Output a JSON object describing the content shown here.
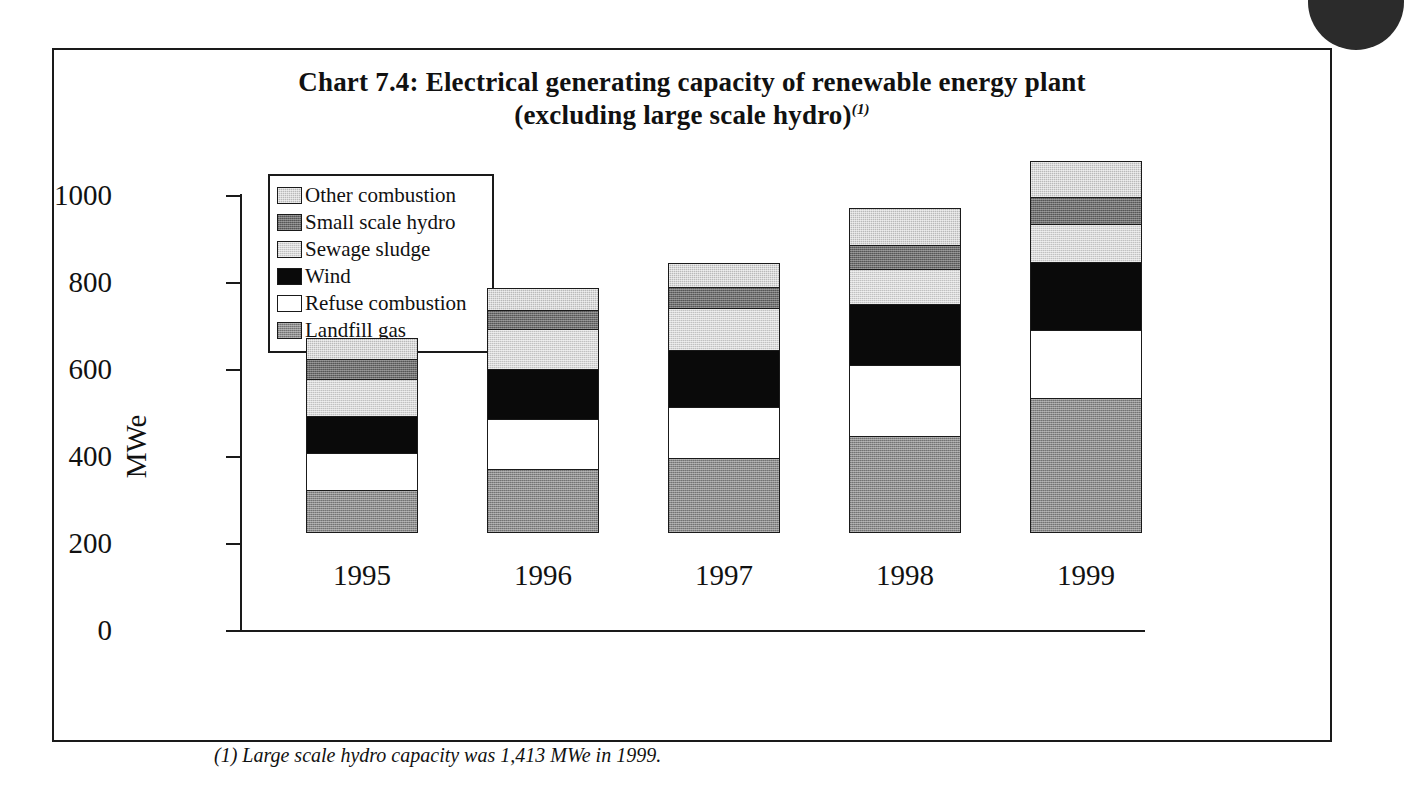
{
  "figure": {
    "title_line1": "Chart 7.4:  Electrical generating capacity of renewable energy plant",
    "title_line2": "(excluding large scale hydro)",
    "title_superscript": "(1)",
    "footnote": "(1) Large scale hydro capacity was 1,413 MWe in 1999."
  },
  "axes": {
    "ylabel": "MWe",
    "yticks": [
      "0",
      "200",
      "400",
      "600",
      "800",
      "1000"
    ],
    "xticks": [
      "1995",
      "1996",
      "1997",
      "1998",
      "1999"
    ]
  },
  "legend": {
    "items": [
      {
        "label": "Other combustion",
        "key": "other-combustion",
        "color": "#b9b9b9"
      },
      {
        "label": "Small scale hydro",
        "key": "small-scale-hydro",
        "color": "#6e6e6e"
      },
      {
        "label": "Sewage sludge",
        "key": "sewage-sludge",
        "color": "#d8d8d8"
      },
      {
        "label": "Wind",
        "key": "wind",
        "color": "#0a0a0a"
      },
      {
        "label": "Refuse combustion",
        "key": "refuse-combustion",
        "color": "#ffffff"
      },
      {
        "label": "Landfill gas",
        "key": "landfill-gas",
        "color": "#8c8c8c"
      }
    ]
  },
  "chart_data": {
    "type": "bar",
    "stacked": true,
    "title": "Chart 7.4: Electrical generating capacity of renewable energy plant (excluding large scale hydro)",
    "xlabel": "",
    "ylabel": "MWe",
    "ylim": [
      0,
      1000
    ],
    "ytick_step": 200,
    "grid": false,
    "legend_position": "upper-left-inside",
    "categories": [
      "1995",
      "1996",
      "1997",
      "1998",
      "1999"
    ],
    "series": [
      {
        "name": "Landfill gas",
        "values": [
          100,
          148,
          172,
          224,
          310
        ]
      },
      {
        "name": "Refuse combustion",
        "values": [
          85,
          115,
          117,
          162,
          157
        ]
      },
      {
        "name": "Wind",
        "values": [
          85,
          115,
          132,
          140,
          155
        ]
      },
      {
        "name": "Sewage sludge",
        "values": [
          85,
          90,
          96,
          80,
          88
        ]
      },
      {
        "name": "Small scale hydro",
        "values": [
          45,
          45,
          48,
          55,
          62
        ]
      },
      {
        "name": "Other combustion",
        "values": [
          48,
          50,
          55,
          87,
          83
        ]
      }
    ],
    "totals": [
      448,
      563,
      620,
      748,
      855
    ],
    "units": "MWe",
    "annotations": [
      "(1) Large scale hydro capacity was 1,413 MWe in 1999."
    ]
  }
}
